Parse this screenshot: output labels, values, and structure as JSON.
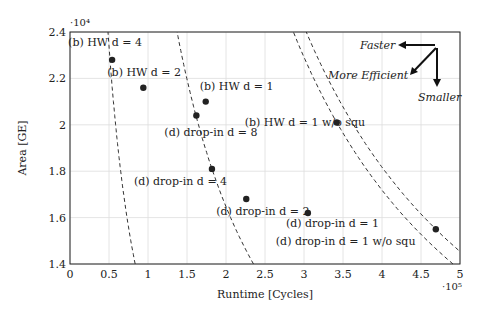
{
  "chart_data": {
    "type": "scatter",
    "title": "",
    "xlabel": "Runtime [Cycles]",
    "ylabel": "Area [GE]",
    "x_multiplier": "·10^5",
    "y_multiplier": "·10^4",
    "xlim": [
      0,
      5
    ],
    "ylim": [
      1.4,
      2.4
    ],
    "xticks": [
      "0",
      "0.5",
      "1",
      "1.5",
      "2",
      "2.5",
      "3",
      "3.5",
      "4",
      "4.5",
      "5"
    ],
    "yticks": [
      "1.4",
      "1.6",
      "1.8",
      "2",
      "2.2",
      "2.4"
    ],
    "grid": true,
    "points": [
      {
        "label": "(b) HW d = 4",
        "x": 0.54,
        "y": 2.28
      },
      {
        "label": "(b) HW d = 2",
        "x": 0.94,
        "y": 2.16
      },
      {
        "label": "(b) HW d = 1",
        "x": 1.74,
        "y": 2.1
      },
      {
        "label": "(d) drop-in d = 8",
        "x": 1.62,
        "y": 2.04
      },
      {
        "label": "(d) drop-in d = 4",
        "x": 1.82,
        "y": 1.81
      },
      {
        "label": "(d) drop-in d = 2",
        "x": 2.26,
        "y": 1.68
      },
      {
        "label": "(d) drop-in d = 1",
        "x": 3.05,
        "y": 1.62
      },
      {
        "label": "(b) HW d = 1 w/o squ",
        "x": 3.42,
        "y": 2.01
      },
      {
        "label": "(d) drop-in d = 1 w/o squ",
        "x": 4.69,
        "y": 1.55
      }
    ],
    "annotations": [
      "Faster",
      "More Efficient",
      "Smaller"
    ],
    "iso_curves": "dashed area-time product curves"
  }
}
